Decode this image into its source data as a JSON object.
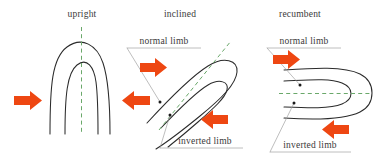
{
  "figure": {
    "colors": {
      "bedding_line": "#2b2b2b",
      "axial_trace": "#6aa86a",
      "stress_arrow": "#ee4712",
      "leader_line": "#9a9a9a",
      "label_text": "#3a3a3a",
      "background": "#ffffff"
    }
  },
  "panels": [
    {
      "id": "upright",
      "title": "upright",
      "axial_trace_orientation": "vertical",
      "limb_labels": [],
      "stress_arrows": [
        {
          "name": "left-compression-arrow",
          "direction": "right"
        },
        {
          "name": "right-compression-arrow",
          "direction": "left"
        }
      ]
    },
    {
      "id": "inclined",
      "title": "inclined",
      "axial_trace_orientation": "inclined",
      "limb_labels": [
        {
          "name": "normal-limb-label",
          "text": "normal limb"
        },
        {
          "name": "inverted-limb-label",
          "text": "inverted limb"
        }
      ],
      "stress_arrows": [
        {
          "name": "upper-compression-arrow",
          "direction": "right"
        },
        {
          "name": "lower-compression-arrow",
          "direction": "left"
        }
      ]
    },
    {
      "id": "recumbent",
      "title": "recumbent",
      "axial_trace_orientation": "horizontal",
      "limb_labels": [
        {
          "name": "normal-limb-label",
          "text": "normal limb"
        },
        {
          "name": "inverted-limb-label",
          "text": "inverted limb"
        }
      ],
      "stress_arrows": [
        {
          "name": "upper-compression-arrow",
          "direction": "right"
        },
        {
          "name": "lower-compression-arrow",
          "direction": "left"
        }
      ]
    }
  ]
}
